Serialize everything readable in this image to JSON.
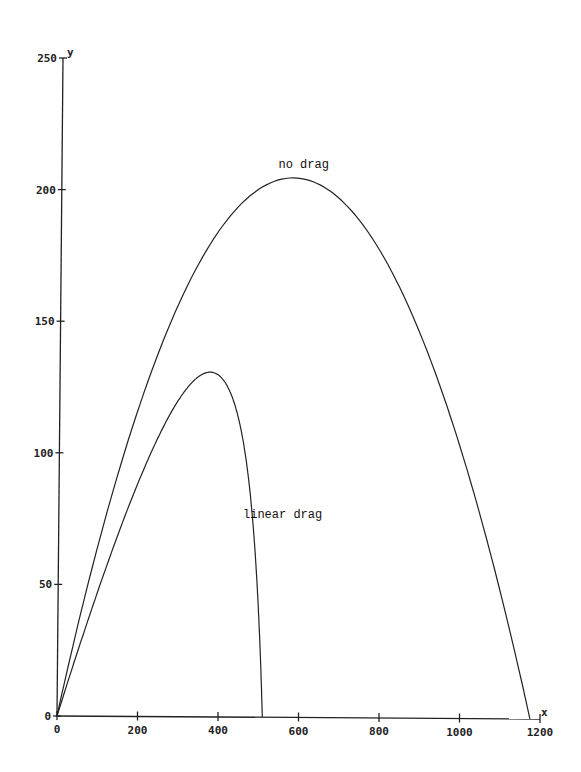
{
  "chart_data": {
    "type": "line",
    "title": "",
    "xlabel": "x",
    "ylabel": "y",
    "xlim": [
      0,
      1200
    ],
    "ylim": [
      0,
      250
    ],
    "grid": false,
    "legend": "none (inline curve labels)",
    "x_ticks": [
      0,
      200,
      400,
      600,
      800,
      1000,
      1200
    ],
    "y_ticks": [
      0,
      50,
      100,
      150,
      200,
      250
    ],
    "series": [
      {
        "name": "no drag",
        "x": [
          0,
          100,
          200,
          300,
          400,
          500,
          587,
          700,
          800,
          900,
          1000,
          1100,
          1175
        ],
        "y": [
          0,
          32,
          58,
          79,
          94,
          102,
          204,
          197,
          186,
          163,
          128,
          80,
          0
        ],
        "peak": {
          "x": 600,
          "y": 205
        },
        "range": 1175
      },
      {
        "name": "linear drag",
        "x": [
          0,
          100,
          200,
          250,
          325,
          400,
          450,
          480,
          510
        ],
        "y": [
          0,
          62,
          108,
          122,
          131,
          118,
          90,
          55,
          0
        ],
        "peak": {
          "x": 325,
          "y": 131
        },
        "range": 510
      }
    ],
    "annotations": [
      {
        "text": "no drag",
        "x": 600,
        "y": 212
      },
      {
        "text": "linear drag",
        "x": 460,
        "y": 78
      }
    ]
  },
  "labels": {
    "x_axis": "x",
    "y_axis": "y",
    "no_drag": "no drag",
    "linear_drag": "linear drag"
  }
}
